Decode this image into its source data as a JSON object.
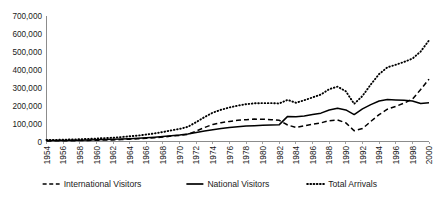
{
  "chart_data": {
    "type": "line",
    "title": "",
    "xlabel": "",
    "ylabel": "",
    "grid": false,
    "legend_position": "bottom",
    "ylim": [
      0,
      700000
    ],
    "ytick_labels": [
      "700,000",
      "600,000",
      "500,000",
      "400,000",
      "300,000",
      "200,000",
      "100,000",
      "0"
    ],
    "yticks": [
      700000,
      600000,
      500000,
      400000,
      300000,
      200000,
      100000,
      0
    ],
    "xlim": [
      1954,
      2000
    ],
    "xtick_labels": [
      "1954",
      "1956",
      "1958",
      "1960",
      "1962",
      "1964",
      "1966",
      "1968",
      "1970",
      "1972",
      "1974",
      "1976",
      "1978",
      "1980",
      "1982",
      "1984",
      "1986",
      "1988",
      "1990",
      "1992",
      "1994",
      "1996",
      "1998",
      "2000"
    ],
    "x": [
      1954,
      1955,
      1956,
      1957,
      1958,
      1959,
      1960,
      1961,
      1962,
      1963,
      1964,
      1965,
      1966,
      1967,
      1968,
      1969,
      1970,
      1971,
      1972,
      1973,
      1974,
      1975,
      1976,
      1977,
      1978,
      1979,
      1980,
      1981,
      1982,
      1983,
      1984,
      1985,
      1986,
      1987,
      1988,
      1989,
      1990,
      1991,
      1992,
      1993,
      1994,
      1995,
      1996,
      1997,
      1998,
      1999,
      2000
    ],
    "series": [
      {
        "name": "International Visitors",
        "style": "dashed",
        "values": [
          3000,
          3500,
          4000,
          4500,
          5000,
          6000,
          7000,
          8000,
          9000,
          11000,
          13000,
          15000,
          18000,
          21000,
          25000,
          30000,
          34000,
          40000,
          58000,
          78000,
          95000,
          105000,
          112000,
          118000,
          122000,
          125000,
          124000,
          122000,
          118000,
          92000,
          78000,
          88000,
          96000,
          104000,
          116000,
          120000,
          104000,
          60000,
          72000,
          112000,
          150000,
          180000,
          196000,
          214000,
          236000,
          290000,
          348000
        ]
      },
      {
        "name": "National Visitors",
        "style": "solid",
        "values": [
          5000,
          5500,
          6000,
          6800,
          7500,
          8500,
          9500,
          11000,
          12000,
          14000,
          16000,
          18000,
          21000,
          24000,
          28000,
          32000,
          36000,
          42000,
          50000,
          58000,
          66000,
          72000,
          78000,
          82000,
          86000,
          88000,
          90000,
          92000,
          94000,
          140000,
          138000,
          142000,
          150000,
          158000,
          176000,
          186000,
          176000,
          150000,
          182000,
          206000,
          226000,
          234000,
          232000,
          230000,
          226000,
          212000,
          216000
        ]
      },
      {
        "name": "Total Arrivals",
        "style": "dotted",
        "values": [
          8000,
          9000,
          10000,
          11300,
          12500,
          14500,
          16500,
          19000,
          21000,
          25000,
          29000,
          33000,
          39000,
          45000,
          53000,
          62000,
          70000,
          82000,
          108000,
          136000,
          161000,
          177000,
          190000,
          200000,
          208000,
          213000,
          214000,
          214000,
          212000,
          232000,
          216000,
          230000,
          246000,
          262000,
          292000,
          306000,
          280000,
          210000,
          254000,
          318000,
          376000,
          414000,
          428000,
          444000,
          462000,
          502000,
          564000
        ]
      }
    ],
    "legend": [
      {
        "label": "International Visitors",
        "style": "dashed"
      },
      {
        "label": "National Visitors",
        "style": "solid"
      },
      {
        "label": "Total Arrivals",
        "style": "dotted"
      }
    ]
  }
}
